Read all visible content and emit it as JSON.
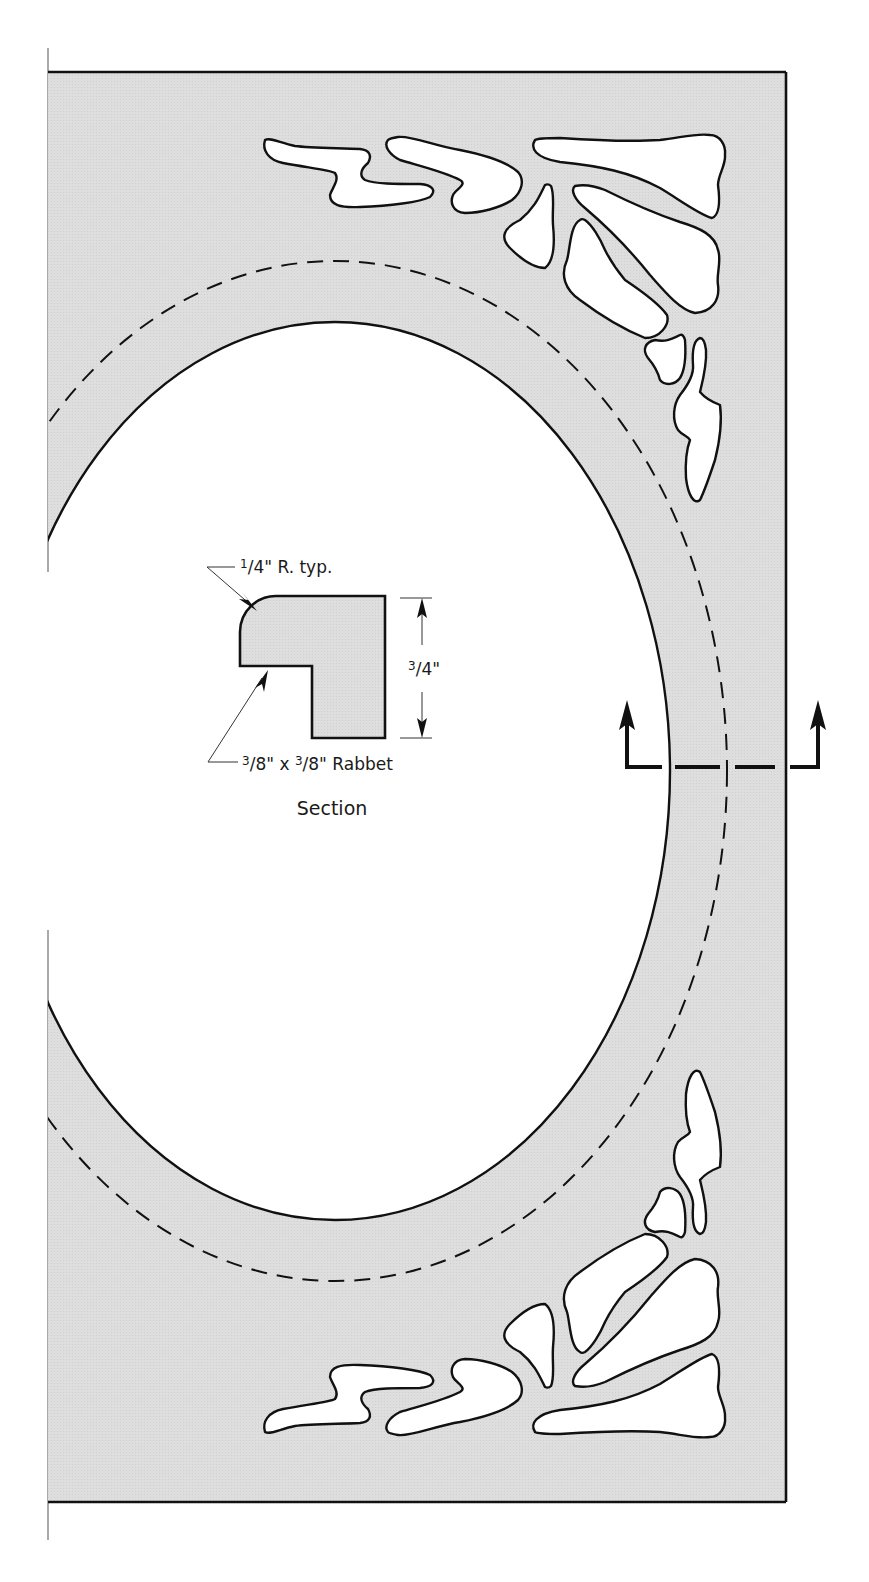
{
  "figure": {
    "type": "woodworking-plan"
  },
  "colors": {
    "panel_fill": "#dcdcdc",
    "line": "#111111",
    "background": "#ffffff"
  },
  "section_detail": {
    "title": "Section",
    "radius_note": "¼\" R. typ.",
    "radius_note_num": "1",
    "radius_note_den": "4",
    "radius_note_suffix": "\" R. typ.",
    "rabbet_note": "⅜\" x ⅜\" Rabbet",
    "rabbet_num1": "3",
    "rabbet_den1": "8",
    "rabbet_mid": "\" x ",
    "rabbet_num2": "3",
    "rabbet_den2": "8",
    "rabbet_suffix": "\" Rabbet",
    "thickness_dim": "¾\"",
    "thickness_num": "3",
    "thickness_den": "4",
    "thickness_suffix": "\""
  },
  "annotations": {
    "section_cut_marker": "section cut line with arrows pointing up",
    "inner_opening": "solid oval line",
    "rabbet_line": "dashed oval line"
  }
}
